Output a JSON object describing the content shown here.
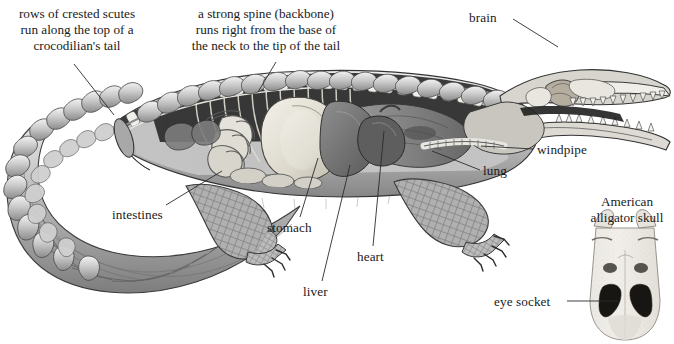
{
  "figure": {
    "background_color": "#ffffff",
    "ink_color": "#1a1a1a",
    "leader_line_color": "#2b2b2b"
  },
  "captions": [
    {
      "name": "caption-scutes",
      "lines": [
        "rows of crested scutes",
        "run along the top of a",
        "crocodilian's tail"
      ],
      "x": 77,
      "y": 6,
      "leader": {
        "x1": 74,
        "y1": 64,
        "x2": 114,
        "y2": 115
      }
    },
    {
      "name": "caption-spine",
      "lines": [
        "a strong spine (backbone)",
        "runs right from the base of",
        "the neck to the tip of the tail"
      ],
      "x": 266,
      "y": 6,
      "leader": {
        "x1": 276,
        "y1": 62,
        "x2": 258,
        "y2": 92
      }
    }
  ],
  "labels": [
    {
      "name": "label-brain",
      "text": "brain",
      "x": 469,
      "y": 10,
      "align": "left",
      "leader": {
        "x1": 513,
        "y1": 19,
        "x2": 558,
        "y2": 47
      }
    },
    {
      "name": "label-windpipe",
      "text": "windpipe",
      "x": 537,
      "y": 142,
      "align": "left",
      "leader": {
        "x1": 533,
        "y1": 149,
        "x2": 481,
        "y2": 146
      }
    },
    {
      "name": "label-lung",
      "text": "lung",
      "x": 483,
      "y": 163,
      "align": "left",
      "leader": {
        "x1": 480,
        "y1": 170,
        "x2": 432,
        "y2": 151
      }
    },
    {
      "name": "label-intestines",
      "text": "intestines",
      "x": 112,
      "y": 207,
      "align": "left",
      "leader": {
        "x1": 166,
        "y1": 205,
        "x2": 222,
        "y2": 171
      }
    },
    {
      "name": "label-stomach",
      "text": "stomach",
      "x": 267,
      "y": 220,
      "align": "left",
      "leader": {
        "x1": 300,
        "y1": 217,
        "x2": 318,
        "y2": 158
      }
    },
    {
      "name": "label-heart",
      "text": "heart",
      "x": 357,
      "y": 249,
      "align": "left",
      "leader": {
        "x1": 373,
        "y1": 246,
        "x2": 384,
        "y2": 131
      }
    },
    {
      "name": "label-liver",
      "text": "liver",
      "x": 303,
      "y": 284,
      "align": "left",
      "leader": {
        "x1": 322,
        "y1": 281,
        "x2": 350,
        "y2": 165
      }
    },
    {
      "name": "label-eye-socket",
      "text": "eye socket",
      "x": 494,
      "y": 294,
      "align": "left",
      "leader": {
        "x1": 567,
        "y1": 301,
        "x2": 618,
        "y2": 301
      }
    }
  ],
  "inset": {
    "name": "american-alligator-skull-inset",
    "caption_lines": [
      "American",
      "alligator skull"
    ],
    "caption_x": 627,
    "caption_y": 194
  }
}
